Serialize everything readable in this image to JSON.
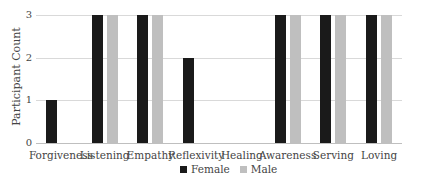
{
  "chart_data": {
    "type": "bar",
    "title": "",
    "xlabel": "",
    "ylabel": "Participant Count",
    "ylim": [
      0,
      3
    ],
    "yticks": [
      "0",
      "1",
      "2",
      "3"
    ],
    "grid": true,
    "legend_position": "bottom",
    "categories": [
      "Forgiveness",
      "Listening",
      "Empathy",
      "Reflexivity",
      "Healing",
      "Awareness",
      "Serving",
      "Loving"
    ],
    "series": [
      {
        "name": "Female",
        "color": "#1a1a1a",
        "values": [
          1,
          3,
          3,
          2,
          0,
          3,
          3,
          3
        ]
      },
      {
        "name": "Male",
        "color": "#bfbfbf",
        "values": [
          0,
          3,
          3,
          0,
          0,
          3,
          3,
          3
        ]
      }
    ]
  }
}
